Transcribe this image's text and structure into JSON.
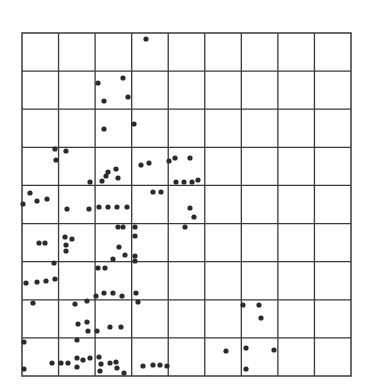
{
  "chart_data": {
    "type": "scatter",
    "title": "",
    "xlabel": "",
    "ylabel": "",
    "grid": true,
    "legend": null,
    "grid_cells": {
      "columns": 9,
      "rows": 9
    },
    "pixel_extent": {
      "left": 22,
      "top": 33,
      "right": 351,
      "bottom": 376
    },
    "colors": {
      "grid": "#3a3a3a",
      "points": "#2b2b2b",
      "background": "#ffffff"
    },
    "points_px": [
      [
        146,
        39
      ],
      [
        98,
        83
      ],
      [
        123,
        78
      ],
      [
        104,
        101
      ],
      [
        128,
        97
      ],
      [
        104,
        129
      ],
      [
        134,
        124
      ],
      [
        55,
        149
      ],
      [
        66,
        151
      ],
      [
        56,
        160
      ],
      [
        90,
        182
      ],
      [
        102,
        181
      ],
      [
        108,
        172
      ],
      [
        116,
        169
      ],
      [
        106,
        176
      ],
      [
        118,
        178
      ],
      [
        141,
        165
      ],
      [
        149,
        163
      ],
      [
        169,
        161
      ],
      [
        175,
        158
      ],
      [
        190,
        158
      ],
      [
        176,
        182
      ],
      [
        184,
        182
      ],
      [
        192,
        182
      ],
      [
        198,
        180
      ],
      [
        30,
        193
      ],
      [
        23,
        204
      ],
      [
        37,
        201
      ],
      [
        47,
        199
      ],
      [
        67,
        209
      ],
      [
        89,
        209
      ],
      [
        99,
        207
      ],
      [
        108,
        207
      ],
      [
        117,
        207
      ],
      [
        127,
        207
      ],
      [
        153,
        192
      ],
      [
        161,
        192
      ],
      [
        190,
        208
      ],
      [
        194,
        217
      ],
      [
        185,
        227
      ],
      [
        39,
        243
      ],
      [
        45,
        243
      ],
      [
        65,
        237
      ],
      [
        66,
        245
      ],
      [
        66,
        251
      ],
      [
        72,
        239
      ],
      [
        118,
        227
      ],
      [
        123,
        227
      ],
      [
        135,
        227
      ],
      [
        135,
        236
      ],
      [
        119,
        247
      ],
      [
        125,
        255
      ],
      [
        135,
        256
      ],
      [
        135,
        261
      ],
      [
        54,
        263
      ],
      [
        26,
        283
      ],
      [
        37,
        282
      ],
      [
        46,
        281
      ],
      [
        55,
        279
      ],
      [
        98,
        268
      ],
      [
        105,
        268
      ],
      [
        113,
        259
      ],
      [
        96,
        296
      ],
      [
        104,
        293
      ],
      [
        113,
        293
      ],
      [
        122,
        296
      ],
      [
        136,
        293
      ],
      [
        138,
        302
      ],
      [
        33,
        303
      ],
      [
        75,
        304
      ],
      [
        87,
        301
      ],
      [
        78,
        324
      ],
      [
        87,
        322
      ],
      [
        88,
        331
      ],
      [
        97,
        331
      ],
      [
        110,
        327
      ],
      [
        121,
        327
      ],
      [
        243,
        305
      ],
      [
        259,
        305
      ],
      [
        261,
        318
      ],
      [
        24,
        342
      ],
      [
        24,
        369
      ],
      [
        77,
        340
      ],
      [
        52,
        363
      ],
      [
        61,
        363
      ],
      [
        68,
        363
      ],
      [
        77,
        367
      ],
      [
        77,
        358
      ],
      [
        83,
        360
      ],
      [
        90,
        358
      ],
      [
        99,
        357
      ],
      [
        101,
        364
      ],
      [
        110,
        363
      ],
      [
        116,
        362
      ],
      [
        100,
        371
      ],
      [
        117,
        368
      ],
      [
        124,
        373
      ],
      [
        143,
        366
      ],
      [
        153,
        365
      ],
      [
        160,
        365
      ],
      [
        167,
        366
      ],
      [
        226,
        351
      ],
      [
        246,
        348
      ],
      [
        274,
        350
      ],
      [
        246,
        369
      ]
    ]
  }
}
